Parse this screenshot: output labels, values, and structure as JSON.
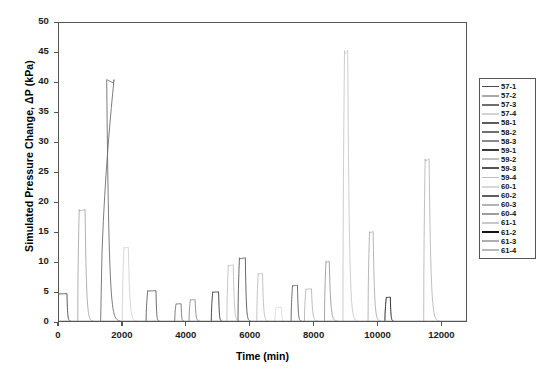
{
  "chart_data": {
    "type": "line",
    "title": "",
    "xlabel": "Time (min)",
    "ylabel": "Simulated Pressure Change, ΔP (kPa)",
    "xlim": [
      0,
      12800
    ],
    "ylim": [
      0,
      50
    ],
    "xticks": [
      0,
      2000,
      4000,
      6000,
      8000,
      10000,
      12000
    ],
    "xtick_labels": [
      "0",
      "2000",
      "4000",
      "6000",
      "8000",
      "10000",
      "12000"
    ],
    "yticks": [
      0,
      5,
      10,
      15,
      20,
      25,
      30,
      35,
      40,
      45,
      50
    ],
    "ytick_labels": [
      "0",
      "5",
      "10",
      "15",
      "20",
      "25",
      "30",
      "35",
      "40",
      "45",
      "50"
    ],
    "grid": false,
    "legend_position": "outside-right",
    "legend_entries": [
      {
        "label": "57-1",
        "color": "#4a4a4a"
      },
      {
        "label": "57-2",
        "color": "#a8a8a8"
      },
      {
        "label": "57-3",
        "color": "#6e6e6e"
      },
      {
        "label": "57-4",
        "color": "#d2d2d2"
      },
      {
        "label": "58-1",
        "color": "#5c5c5c"
      },
      {
        "label": "58-2",
        "color": "#717171"
      },
      {
        "label": "58-3",
        "color": "#8a8a8a"
      },
      {
        "label": "59-1",
        "color": "#3a3a3a"
      },
      {
        "label": "59-2",
        "color": "#c0c0c0"
      },
      {
        "label": "59-3",
        "color": "#555555"
      },
      {
        "label": "59-4",
        "color": "#bdbdbd"
      },
      {
        "label": "60-1",
        "color": "#d8d8d8"
      },
      {
        "label": "60-2",
        "color": "#5f5f5f"
      },
      {
        "label": "60-3",
        "color": "#b4b4b4"
      },
      {
        "label": "60-4",
        "color": "#9c9c9c"
      },
      {
        "label": "61-1",
        "color": "#c8c8c8"
      },
      {
        "label": "61-2",
        "color": "#161616"
      },
      {
        "label": "61-3",
        "color": "#aeaeae"
      },
      {
        "label": "61-4",
        "color": "#b8b8b8"
      }
    ],
    "series": [
      {
        "name": "57-1",
        "color": "#4a4a4a",
        "peak_time": 250,
        "peak_value": 4.6,
        "rise": 60,
        "width": 330,
        "tail": 120
      },
      {
        "name": "57-2",
        "color": "#a8a8a8",
        "peak_time": 820,
        "peak_value": 18.7,
        "rise": 45,
        "width": 230,
        "tail": 260
      },
      {
        "name": "57-3",
        "color": "#6e6e6e",
        "peak_time": 1500,
        "peak_value": 40.5,
        "rise": 420,
        "width": 190,
        "tail": 430
      },
      {
        "name": "57-4",
        "color": "#d2d2d2",
        "peak_time": 2180,
        "peak_value": 12.4,
        "rise": 55,
        "width": 190,
        "tail": 280
      },
      {
        "name": "58-1",
        "color": "#5c5c5c",
        "peak_time": 3050,
        "peak_value": 5.1,
        "rise": 50,
        "width": 310,
        "tail": 110
      },
      {
        "name": "58-2",
        "color": "#717171",
        "peak_time": 3840,
        "peak_value": 2.9,
        "rise": 40,
        "width": 200,
        "tail": 90
      },
      {
        "name": "58-3",
        "color": "#8a8a8a",
        "peak_time": 4280,
        "peak_value": 3.6,
        "rise": 40,
        "width": 190,
        "tail": 150
      },
      {
        "name": "59-1",
        "color": "#3a3a3a",
        "peak_time": 5020,
        "peak_value": 4.9,
        "rise": 45,
        "width": 230,
        "tail": 110
      },
      {
        "name": "59-2",
        "color": "#c0c0c0",
        "peak_time": 5480,
        "peak_value": 9.4,
        "rise": 45,
        "width": 200,
        "tail": 200
      },
      {
        "name": "59-3",
        "color": "#555555",
        "peak_time": 5860,
        "peak_value": 10.6,
        "rise": 45,
        "width": 230,
        "tail": 170
      },
      {
        "name": "59-4",
        "color": "#bdbdbd",
        "peak_time": 6400,
        "peak_value": 8.0,
        "rise": 45,
        "width": 180,
        "tail": 190
      },
      {
        "name": "60-1",
        "color": "#d8d8d8",
        "peak_time": 7000,
        "peak_value": 2.3,
        "rise": 40,
        "width": 210,
        "tail": 80
      },
      {
        "name": "60-2",
        "color": "#5f5f5f",
        "peak_time": 7500,
        "peak_value": 6.0,
        "rise": 45,
        "width": 200,
        "tail": 130
      },
      {
        "name": "60-3",
        "color": "#b4b4b4",
        "peak_time": 7940,
        "peak_value": 5.4,
        "rise": 45,
        "width": 220,
        "tail": 210
      },
      {
        "name": "60-4",
        "color": "#9c9c9c",
        "peak_time": 8500,
        "peak_value": 10.0,
        "rise": 45,
        "width": 150,
        "tail": 260
      },
      {
        "name": "61-1",
        "color": "#c8c8c8",
        "peak_time": 9080,
        "peak_value": 45.4,
        "rise": 50,
        "width": 150,
        "tail": 300
      },
      {
        "name": "61-2",
        "color": "#161616",
        "peak_time": 10420,
        "peak_value": 4.0,
        "rise": 45,
        "width": 170,
        "tail": 110
      },
      {
        "name": "61-3",
        "color": "#aeaeae",
        "peak_time": 9880,
        "peak_value": 15.0,
        "rise": 45,
        "width": 160,
        "tail": 240
      },
      {
        "name": "61-4",
        "color": "#b8b8b8",
        "peak_time": 11640,
        "peak_value": 27.2,
        "rise": 45,
        "width": 170,
        "tail": 330
      }
    ]
  }
}
